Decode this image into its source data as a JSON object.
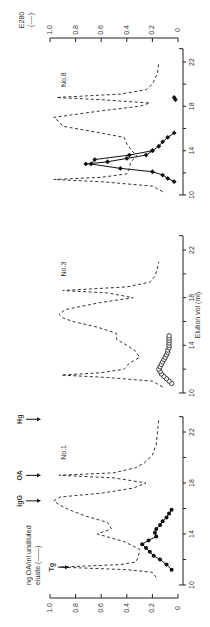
{
  "figure": {
    "x_axis_label": "Elution vol (ml)",
    "left_axis_label_line1": "ng OA/ml undiluted",
    "left_axis_label_line2": "eluate (——)",
    "right_axis_label_line1": "E280",
    "right_axis_label_line2": "(----)",
    "markers": [
      "Tg",
      "IgG",
      "OA",
      "Hg"
    ]
  },
  "chart_data": [
    {
      "type": "line",
      "title": "No.1",
      "xlabel": "Elution vol (ml)",
      "ylabel": "ng OA/ml undiluted eluate (——) / E280 (----)",
      "xlim": [
        10,
        23
      ],
      "ylim": [
        0,
        1.0
      ],
      "x_ticks": [
        10,
        14,
        18,
        22
      ],
      "y_ticks": [
        0,
        0.2,
        0.4,
        0.6,
        0.8,
        1.0
      ],
      "annotations": [
        {
          "label": "Tg",
          "x": 11.4
        },
        {
          "label": "IgG",
          "x": 16.6
        },
        {
          "label": "OA",
          "x": 18.6
        },
        {
          "label": "Hg",
          "x": 23.0
        }
      ],
      "series": [
        {
          "name": "ng OA/ml (solid, filled circles)",
          "marker": "filled-circle",
          "x": [
            11.2,
            11.6,
            12.0,
            12.3,
            12.6,
            12.9,
            13.2,
            13.5,
            13.8,
            14.1,
            14.4,
            14.7,
            15.0,
            15.3,
            15.6,
            15.9
          ],
          "y": [
            0.05,
            0.09,
            0.14,
            0.19,
            0.22,
            0.25,
            0.28,
            0.23,
            0.17,
            0.18,
            0.17,
            0.14,
            0.12,
            0.09,
            0.07,
            0.05
          ]
        },
        {
          "name": "E280 (dashed)",
          "marker": "none",
          "x": [
            10.6,
            11.0,
            11.2,
            11.4,
            11.6,
            11.8,
            12.2,
            12.8,
            13.4,
            14.0,
            14.4,
            14.9,
            15.4,
            15.9,
            16.3,
            16.6,
            16.9,
            17.2,
            17.6,
            18.0,
            18.4,
            18.6,
            18.8,
            19.2,
            19.6,
            20.2,
            21.0,
            22.0,
            23.0
          ],
          "y": [
            0.17,
            0.2,
            0.4,
            0.92,
            0.45,
            0.33,
            0.31,
            0.3,
            0.42,
            0.63,
            0.52,
            0.55,
            0.72,
            0.85,
            0.93,
            0.97,
            0.92,
            0.6,
            0.35,
            0.25,
            0.5,
            0.93,
            0.5,
            0.33,
            0.26,
            0.2,
            0.17,
            0.16,
            0.15
          ]
        }
      ]
    },
    {
      "type": "line",
      "title": "No.3",
      "xlabel": "Elution vol (ml)",
      "xlim": [
        10,
        23
      ],
      "ylim": [
        0,
        1.0
      ],
      "x_ticks": [
        10,
        14,
        18,
        22
      ],
      "series": [
        {
          "name": "ng OA/ml (solid, open circles)",
          "marker": "open-circle",
          "x": [
            10.8,
            11.0,
            11.2,
            11.4,
            11.6,
            11.8,
            12.0,
            12.2,
            12.4,
            12.6,
            12.8,
            13.0,
            13.2,
            13.4,
            13.6,
            13.8,
            14.0,
            14.2,
            14.4,
            14.6,
            14.8
          ],
          "y": [
            0.05,
            0.07,
            0.09,
            0.11,
            0.13,
            0.14,
            0.15,
            0.14,
            0.13,
            0.12,
            0.11,
            0.1,
            0.09,
            0.08,
            0.08,
            0.07,
            0.07,
            0.07,
            0.07,
            0.07,
            0.07
          ]
        },
        {
          "name": "E280 (dashed)",
          "marker": "none",
          "x": [
            10.5,
            11.0,
            11.3,
            11.5,
            11.7,
            12.0,
            12.5,
            13.0,
            13.5,
            14.0,
            14.5,
            15.0,
            15.5,
            16.0,
            16.3,
            16.6,
            17.0,
            17.6,
            18.0,
            18.4,
            18.6,
            18.9,
            19.3,
            19.8,
            20.5,
            21.0
          ],
          "y": [
            0.12,
            0.2,
            0.55,
            0.91,
            0.6,
            0.42,
            0.38,
            0.3,
            0.33,
            0.4,
            0.48,
            0.48,
            0.62,
            0.82,
            0.9,
            0.93,
            0.88,
            0.6,
            0.35,
            0.55,
            0.9,
            0.4,
            0.22,
            0.18,
            0.16,
            0.15
          ]
        }
      ]
    },
    {
      "type": "line",
      "title": "No.8",
      "xlabel": "Elution vol (ml)",
      "ylabel_right": "E280 (----)",
      "xlim": [
        10,
        23
      ],
      "ylim": [
        0,
        1.0
      ],
      "x_ticks": [
        10,
        14,
        18,
        22
      ],
      "y_ticks": [
        0,
        0.2,
        0.4,
        0.6,
        0.8,
        1.0
      ],
      "series": [
        {
          "name": "ng OA/ml (solid, filled diamonds)",
          "marker": "filled-diamond",
          "x": [
            11.2,
            11.5,
            11.8,
            12.1,
            12.4,
            12.8,
            13.2,
            13.6,
            14.0,
            14.4,
            14.8,
            15.2,
            15.6,
            18.6,
            18.8
          ],
          "y": [
            0.03,
            0.08,
            0.12,
            0.2,
            0.45,
            0.68,
            0.65,
            0.38,
            0.2,
            0.15,
            0.12,
            0.08,
            0.03,
            0.02,
            0.03
          ]
        },
        {
          "name": "ng OA/ml branch 2",
          "marker": "filled-diamond",
          "x": [
            12.8,
            13.0,
            13.3,
            13.6,
            14.0
          ],
          "y": [
            0.72,
            0.55,
            0.4,
            0.25,
            0.2
          ]
        },
        {
          "name": "E280 (dashed)",
          "marker": "none",
          "x": [
            10.3,
            10.8,
            11.2,
            11.4,
            11.6,
            11.9,
            12.4,
            13.0,
            13.5,
            14.0,
            14.6,
            15.2,
            15.8,
            16.2,
            16.6,
            17.0,
            17.6,
            18.0,
            18.3,
            18.6,
            18.8,
            19.1,
            19.5,
            20.0,
            21.0,
            22.0
          ],
          "y": [
            0.12,
            0.2,
            0.6,
            0.97,
            0.6,
            0.4,
            0.38,
            0.37,
            0.32,
            0.36,
            0.4,
            0.42,
            0.7,
            0.9,
            0.93,
            0.97,
            0.6,
            0.3,
            0.22,
            0.6,
            0.95,
            0.45,
            0.25,
            0.2,
            0.16,
            0.15
          ]
        }
      ]
    }
  ],
  "panels_layout": [
    {
      "title": "No.8",
      "y10": 195,
      "y22": 62
    },
    {
      "title": "No.3",
      "y10": 393,
      "y22": 250
    },
    {
      "title": "No.1",
      "y10": 585,
      "y22": 432
    }
  ]
}
